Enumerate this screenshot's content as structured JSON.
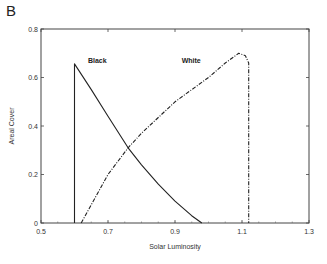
{
  "panel_label": "B",
  "chart_data": {
    "type": "line",
    "title": "",
    "xlabel": "Solar Luminosity",
    "ylabel": "Areal Cover",
    "xlim": [
      0.5,
      1.3
    ],
    "ylim": [
      0,
      0.8
    ],
    "x_ticks": [
      "0.5",
      "0.7",
      "0.9",
      "1.1",
      "1.3"
    ],
    "y_ticks": [
      "0",
      "0.2",
      "0.4",
      "0.6",
      "0.8"
    ],
    "grid": false,
    "legend": "inline labels",
    "series": [
      {
        "name": "Black",
        "style": "solid",
        "x": [
          0.6,
          0.6,
          0.65,
          0.7,
          0.76,
          0.8,
          0.85,
          0.9,
          0.95,
          0.98
        ],
        "values": [
          0,
          0.656,
          0.55,
          0.44,
          0.31,
          0.24,
          0.16,
          0.09,
          0.03,
          0
        ]
      },
      {
        "name": "White",
        "style": "dash-dot",
        "x": [
          0.62,
          0.7,
          0.76,
          0.8,
          0.9,
          1.0,
          1.05,
          1.09,
          1.11,
          1.12,
          1.12
        ],
        "values": [
          0,
          0.2,
          0.31,
          0.37,
          0.5,
          0.6,
          0.66,
          0.7,
          0.69,
          0.66,
          0
        ]
      }
    ],
    "annotations": [
      {
        "text": "Black",
        "x": 0.64,
        "y": 0.66
      },
      {
        "text": "White",
        "x": 0.92,
        "y": 0.66
      }
    ]
  }
}
